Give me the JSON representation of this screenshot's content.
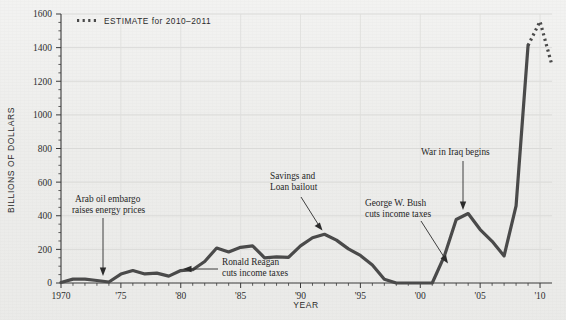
{
  "chart_data": {
    "type": "line",
    "title": "",
    "xlabel": "YEAR",
    "ylabel": "BILLIONS OF DOLLARS",
    "xlim": [
      1970,
      2011
    ],
    "ylim": [
      0,
      1600
    ],
    "grid": true,
    "y_ticks": [
      0,
      200,
      400,
      600,
      800,
      1000,
      1200,
      1400,
      1600
    ],
    "y_tick_labels": [
      "0",
      "200",
      "400",
      "600",
      "800",
      "1000",
      "1200",
      "1400",
      "1600"
    ],
    "x_ticks": [
      1970,
      1975,
      1980,
      1985,
      1990,
      1995,
      2000,
      2005,
      2010
    ],
    "x_tick_labels": [
      "1970",
      "'75",
      "'80",
      "'85",
      "'90",
      "'95",
      "'00",
      "'05",
      "'10"
    ],
    "legend_position": "top-left",
    "series": [
      {
        "name": "Actual",
        "style": "solid",
        "x": [
          1970,
          1971,
          1972,
          1973,
          1974,
          1975,
          1976,
          1977,
          1978,
          1979,
          1980,
          1981,
          1982,
          1983,
          1984,
          1985,
          1986,
          1987,
          1988,
          1989,
          1990,
          1991,
          1992,
          1993,
          1994,
          1995,
          1996,
          1997,
          1998,
          1999,
          2000,
          2001,
          2002,
          2003,
          2004,
          2005,
          2006,
          2007,
          2008,
          2009
        ],
        "values": [
          3,
          23,
          23,
          15,
          6,
          53,
          74,
          54,
          59,
          41,
          74,
          79,
          128,
          208,
          185,
          212,
          221,
          150,
          155,
          153,
          221,
          269,
          290,
          255,
          203,
          164,
          107,
          22,
          0,
          0,
          0,
          0,
          158,
          378,
          413,
          318,
          248,
          161,
          459,
          1413
        ],
        "color": "#4a4a4a"
      },
      {
        "name": "ESTIMATE for 2010–2011",
        "style": "dotted",
        "x": [
          2009,
          2010,
          2011
        ],
        "values": [
          1413,
          1556,
          1294
        ],
        "color": "#4a4a4a"
      }
    ],
    "peak": {
      "year": 2009.6,
      "value": 1556
    },
    "annotations": [
      {
        "id": "arab-oil-embargo",
        "lines": [
          "Arab oil embargo",
          "raises energy prices"
        ],
        "target_year": 1974,
        "target_value": 10
      },
      {
        "id": "ronald-reagan",
        "lines": [
          "Ronald Reagan",
          "cuts income taxes"
        ],
        "target_year": 1981,
        "target_value": 80
      },
      {
        "id": "savings-and-loan",
        "lines": [
          "Savings and",
          "Loan bailout"
        ],
        "target_year": 1991,
        "target_value": 272
      },
      {
        "id": "george-w-bush",
        "lines": [
          "George W. Bush",
          "cuts income taxes"
        ],
        "target_year": 2001,
        "target_value": 10
      },
      {
        "id": "war-in-iraq",
        "lines": [
          "War in Iraq begins"
        ],
        "target_year": 2003,
        "target_value": 382
      }
    ]
  },
  "legend": {
    "label": "ESTIMATE for 2010–2011",
    "swatch_name": "dotted-line-swatch"
  },
  "axes": {
    "y_title": "BILLIONS OF DOLLARS",
    "x_title": "YEAR"
  },
  "colors": {
    "background": "#ececea",
    "line": "#4a4a4a",
    "grid": "#d8d8d6",
    "axis": "#3a3a3a",
    "text": "#2b2b2b"
  }
}
